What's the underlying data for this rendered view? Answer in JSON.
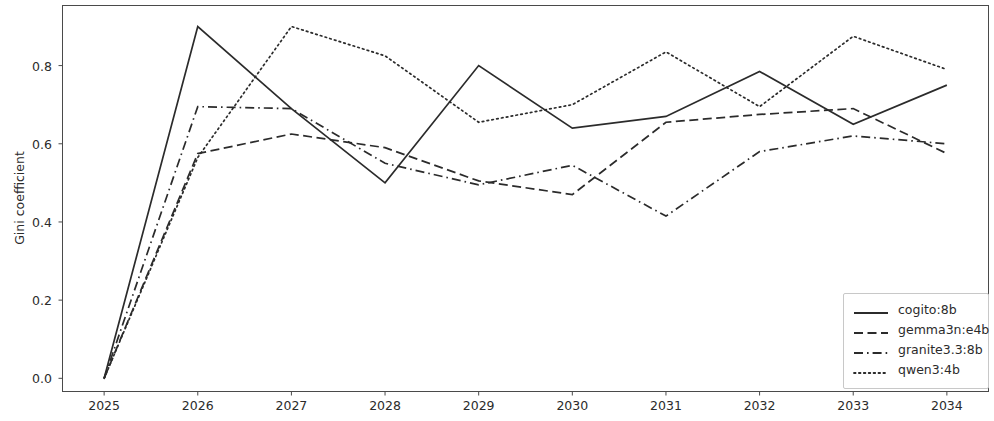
{
  "chart_data": {
    "type": "line",
    "title": "",
    "xlabel": "",
    "ylabel": "Gini coefficient",
    "x": [
      2025,
      2026,
      2027,
      2028,
      2029,
      2030,
      2031,
      2032,
      2033,
      2034
    ],
    "xtick_labels": [
      "2025",
      "2026",
      "2027",
      "2028",
      "2029",
      "2030",
      "2031",
      "2032",
      "2033",
      "2034"
    ],
    "ytick_labels": [
      "0.0",
      "0.2",
      "0.4",
      "0.6",
      "0.8"
    ],
    "ytick_values": [
      0.0,
      0.2,
      0.4,
      0.6,
      0.8
    ],
    "xlim": [
      2024.55,
      2034.45
    ],
    "ylim": [
      -0.035,
      0.955
    ],
    "grid": false,
    "legend_position": "lower right",
    "series": [
      {
        "name": "cogito:8b",
        "linestyle": "solid",
        "color": "#2b2b2b",
        "values": [
          0.0,
          0.9,
          0.69,
          0.5,
          0.8,
          0.64,
          0.67,
          0.785,
          0.65,
          0.75
        ]
      },
      {
        "name": "gemma3n:e4b",
        "linestyle": "dashed",
        "color": "#2b2b2b",
        "values": [
          0.0,
          0.575,
          0.625,
          0.59,
          0.505,
          0.47,
          0.655,
          0.675,
          0.69,
          0.575
        ]
      },
      {
        "name": "granite3.3:8b",
        "linestyle": "dashdot",
        "color": "#2b2b2b",
        "values": [
          0.0,
          0.695,
          0.69,
          0.55,
          0.495,
          0.545,
          0.415,
          0.58,
          0.62,
          0.6
        ]
      },
      {
        "name": "qwen3:4b",
        "linestyle": "dotted",
        "color": "#2b2b2b",
        "values": [
          0.0,
          0.565,
          0.9,
          0.825,
          0.655,
          0.7,
          0.835,
          0.695,
          0.875,
          0.79
        ]
      }
    ]
  },
  "axes": {
    "ylabel": "Gini coefficient",
    "ytick_labels": [
      "0.0",
      "0.2",
      "0.4",
      "0.6",
      "0.8"
    ],
    "xtick_labels": [
      "2025",
      "2026",
      "2027",
      "2028",
      "2029",
      "2030",
      "2031",
      "2032",
      "2033",
      "2034"
    ]
  },
  "legend": {
    "entries": [
      {
        "label": "cogito:8b",
        "style": "solid"
      },
      {
        "label": "gemma3n:e4b",
        "style": "dashed"
      },
      {
        "label": "granite3.3:8b",
        "style": "dashdot"
      },
      {
        "label": "qwen3:4b",
        "style": "dotted"
      }
    ]
  }
}
